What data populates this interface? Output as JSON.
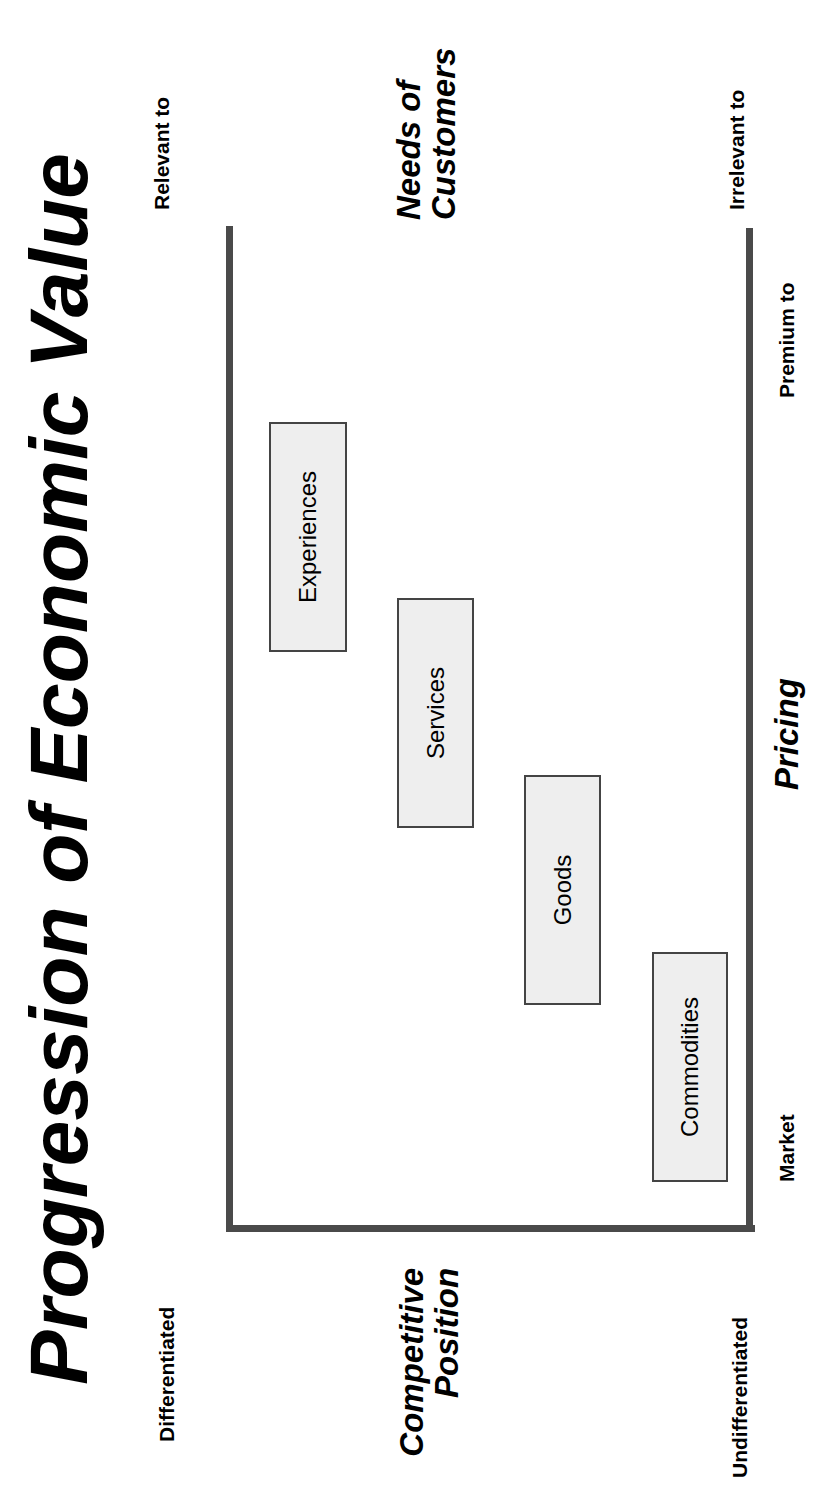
{
  "title": "Progression of Economic Value",
  "axes": {
    "vertical": {
      "title_line1": "Competitive",
      "title_line2": "Position",
      "top_label": "Differentiated",
      "bottom_label": "Undifferentiated"
    },
    "horizontal": {
      "title": "Pricing",
      "left_label": "Market",
      "right_label": "Premium to"
    },
    "top": {
      "title_line1": "Needs of",
      "title_line2": "Customers",
      "left_label": "Relevant to",
      "right_label": "Irrelevant to"
    }
  },
  "stages": [
    {
      "label": "Commodities"
    },
    {
      "label": "Goods"
    },
    {
      "label": "Services"
    },
    {
      "label": "Experiences"
    }
  ],
  "colors": {
    "frame": "#4a4a4a",
    "box_fill": "#eeeeee",
    "box_border": "#444444"
  }
}
